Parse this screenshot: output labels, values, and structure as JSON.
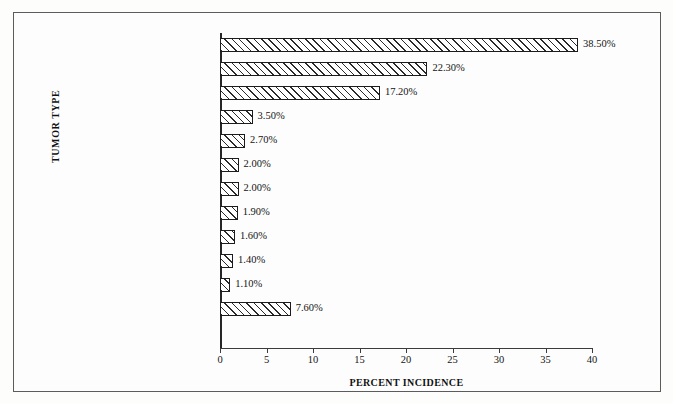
{
  "figure": {
    "background_color": "#fdfdfc",
    "frame_color": "#5c5c5c",
    "bar_edge_color": "#1c1c1c",
    "hatch_color": "#2a2a2a"
  },
  "chart_data": {
    "type": "bar",
    "orientation": "horizontal",
    "title": "",
    "xlabel": "PERCENT INCIDENCE",
    "ylabel": "TUMOR TYPE",
    "xlim": [
      0,
      40
    ],
    "xticks": [
      0,
      5,
      10,
      15,
      20,
      25,
      30,
      35,
      40
    ],
    "xtick_labels": [
      "0",
      "5",
      "10",
      "15",
      "20",
      "25",
      "30",
      "35",
      "40"
    ],
    "grid": false,
    "legend": null,
    "categories": [
      "Lung cancer",
      "Breast cancer",
      "Lymphoma/leukemia",
      "Sarcoma",
      "Melanoma",
      "Stomach",
      "Carcinoma of\nunknown origin",
      "Renal",
      "Gynecologic",
      "Head and neck cancer",
      "Colorectal",
      "Other"
    ],
    "values": [
      38.5,
      22.3,
      17.2,
      3.5,
      2.7,
      2.0,
      2.0,
      1.9,
      1.6,
      1.4,
      1.1,
      7.6
    ],
    "value_labels": [
      "38.50%",
      "22.30%",
      "17.20%",
      "3.50%",
      "2.70%",
      "2.00%",
      "2.00%",
      "1.90%",
      "1.60%",
      "1.40%",
      "1.10%",
      "7.60%"
    ]
  }
}
